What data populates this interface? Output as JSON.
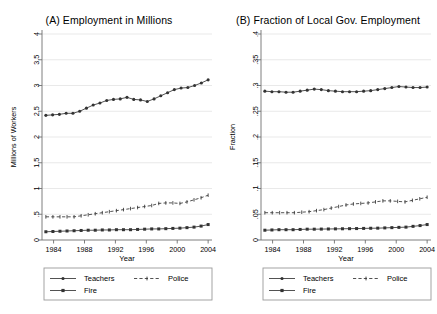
{
  "figure": {
    "background": "#ffffff",
    "axis_color": "#6f6f6f",
    "grid_color": "#e3e3e3",
    "series_color": "#333333"
  },
  "panels": [
    {
      "id": "A",
      "title": "(A) Employment in Millions",
      "xlabel": "Year",
      "ylabel": "Millions of Workers"
    },
    {
      "id": "B",
      "title": "(B) Fraction of Local Gov. Employment",
      "xlabel": "Year",
      "ylabel": "Fraction"
    }
  ],
  "legend": {
    "items": [
      {
        "label": "Teachers",
        "marker": "circle",
        "dash": "solid"
      },
      {
        "label": "Police",
        "marker": "tick",
        "dash": "dashed"
      },
      {
        "label": "Fire",
        "marker": "square",
        "dash": "solid"
      }
    ]
  },
  "chart_data": [
    {
      "type": "line",
      "panel": "A",
      "title": "(A) Employment in Millions",
      "xlabel": "Year",
      "ylabel": "Millions of Workers",
      "xlim": [
        1982.5,
        2004.5
      ],
      "ylim": [
        0,
        4
      ],
      "xticks": [
        1984,
        1988,
        1992,
        1996,
        2000,
        2004
      ],
      "xticklabels": [
        "1984",
        "1988",
        "1992",
        "1996",
        "2000",
        "2004"
      ],
      "yticks": [
        0,
        0.5,
        1,
        1.5,
        2,
        2.5,
        3,
        3.5,
        4
      ],
      "yticklabels": [
        "0",
        ".5",
        "1",
        "1.5",
        "2",
        "2.5",
        "3",
        "3.5",
        "4"
      ],
      "grid": "horizontal",
      "legend_position": "below",
      "x": [
        1983,
        1984,
        1985,
        1986,
        1987,
        1988,
        1989,
        1990,
        1991,
        1992,
        1993,
        1994,
        1995,
        1996,
        1997,
        1998,
        1999,
        2000,
        2001,
        2002,
        2003,
        2004
      ],
      "series": [
        {
          "name": "Teachers",
          "marker": "circle",
          "dash": "solid",
          "values": [
            2.42,
            2.43,
            2.44,
            2.46,
            2.46,
            2.5,
            2.56,
            2.62,
            2.66,
            2.71,
            2.73,
            2.74,
            2.77,
            2.73,
            2.72,
            2.69,
            2.74,
            2.8,
            2.86,
            2.92,
            2.95,
            2.96,
            3.0,
            3.05,
            3.11
          ]
        },
        {
          "name": "Police",
          "marker": "tick",
          "dash": "dashed",
          "values": [
            0.45,
            0.45,
            0.45,
            0.45,
            0.45,
            0.47,
            0.49,
            0.51,
            0.53,
            0.55,
            0.57,
            0.59,
            0.61,
            0.63,
            0.65,
            0.67,
            0.71,
            0.72,
            0.72,
            0.71,
            0.74,
            0.78,
            0.82,
            0.87
          ]
        },
        {
          "name": "Fire",
          "marker": "square",
          "dash": "solid",
          "values": [
            0.16,
            0.165,
            0.17,
            0.175,
            0.18,
            0.185,
            0.19,
            0.19,
            0.195,
            0.195,
            0.2,
            0.2,
            0.2,
            0.205,
            0.21,
            0.215,
            0.215,
            0.22,
            0.225,
            0.23,
            0.24,
            0.25,
            0.27,
            0.3
          ]
        }
      ]
    },
    {
      "type": "line",
      "panel": "B",
      "title": "(B) Fraction of Local Gov. Employment",
      "xlabel": "Year",
      "ylabel": "Fraction",
      "xlim": [
        1982.5,
        2004.5
      ],
      "ylim": [
        0,
        0.4
      ],
      "xticks": [
        1984,
        1988,
        1992,
        1996,
        2000,
        2004
      ],
      "xticklabels": [
        "1984",
        "1988",
        "1992",
        "1996",
        "2000",
        "2004"
      ],
      "yticks": [
        0,
        0.05,
        0.1,
        0.15,
        0.2,
        0.25,
        0.3,
        0.35,
        0.4
      ],
      "yticklabels": [
        "0",
        ".05",
        ".1",
        ".15",
        ".2",
        ".25",
        ".3",
        ".35",
        ".4"
      ],
      "grid": "horizontal",
      "legend_position": "below",
      "x": [
        1983,
        1984,
        1985,
        1986,
        1987,
        1988,
        1989,
        1990,
        1991,
        1992,
        1993,
        1994,
        1995,
        1996,
        1997,
        1998,
        1999,
        2000,
        2001,
        2002,
        2003,
        2004
      ],
      "series": [
        {
          "name": "Teachers",
          "marker": "circle",
          "dash": "solid",
          "values": [
            0.289,
            0.288,
            0.288,
            0.287,
            0.287,
            0.289,
            0.291,
            0.293,
            0.292,
            0.29,
            0.289,
            0.288,
            0.288,
            0.288,
            0.289,
            0.29,
            0.292,
            0.294,
            0.296,
            0.298,
            0.297,
            0.296,
            0.296,
            0.297
          ]
        },
        {
          "name": "Police",
          "marker": "tick",
          "dash": "dashed",
          "values": [
            0.053,
            0.053,
            0.053,
            0.053,
            0.053,
            0.054,
            0.055,
            0.057,
            0.059,
            0.062,
            0.065,
            0.068,
            0.07,
            0.071,
            0.072,
            0.074,
            0.076,
            0.076,
            0.075,
            0.074,
            0.077,
            0.08,
            0.083
          ]
        },
        {
          "name": "Fire",
          "marker": "square",
          "dash": "solid",
          "values": [
            0.019,
            0.0195,
            0.02,
            0.02,
            0.02,
            0.0205,
            0.021,
            0.021,
            0.0212,
            0.0214,
            0.0216,
            0.0218,
            0.022,
            0.0222,
            0.0225,
            0.0228,
            0.023,
            0.0235,
            0.024,
            0.0245,
            0.025,
            0.0265,
            0.028,
            0.03
          ]
        }
      ]
    }
  ]
}
